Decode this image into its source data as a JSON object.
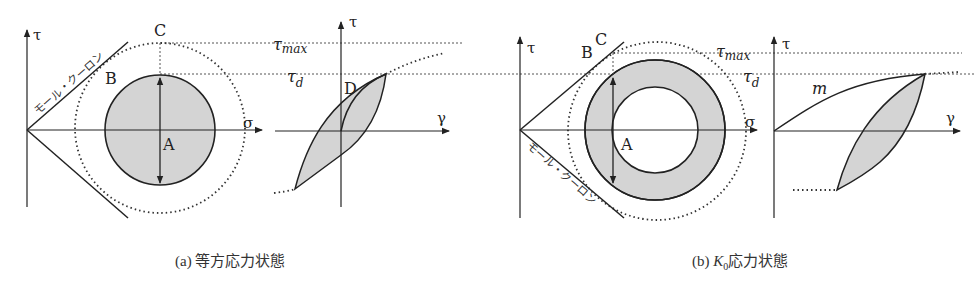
{
  "figure": {
    "panel_a": {
      "caption_prefix": "(a)",
      "caption_text": "等方応力状態",
      "axis_tau": "τ",
      "axis_sigma": "σ",
      "axis_gamma": "γ",
      "mohr_coulomb_label": "モール・クーロン",
      "points": {
        "A": "A",
        "B": "B",
        "C": "C",
        "D": "D"
      },
      "tau_max_label": "τ",
      "tau_max_sub": "max",
      "tau_d_label": "τ",
      "tau_d_sub": "d"
    },
    "panel_b": {
      "caption_prefix": "(b)",
      "caption_k": "K",
      "caption_k_sub": "0",
      "caption_text": "応力状態",
      "axis_tau": "τ",
      "axis_sigma": "σ",
      "axis_gamma": "γ",
      "mohr_coulomb_label": "モール・クーロン",
      "points": {
        "A": "A",
        "B": "B",
        "C": "C"
      },
      "curve_label": "m",
      "tau_max_label": "τ",
      "tau_max_sub": "max",
      "tau_d_label": "τ",
      "tau_d_sub": "d"
    },
    "colors": {
      "line": "#222222",
      "fill": "#d4d4d4",
      "dotted": "#333333"
    }
  }
}
